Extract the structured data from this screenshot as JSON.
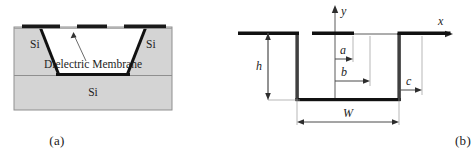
{
  "figure": {
    "panels": [
      {
        "id": "a",
        "caption": "(a)",
        "type": "cross-section-schematic",
        "labels": {
          "si_left": "Si",
          "si_right": "Si",
          "si_bottom": "Si",
          "membrane": "Dielectric Membrane"
        },
        "colors": {
          "substrate_fill": "#d4d4d4",
          "substrate_stroke": "#8c8c8c",
          "membrane_fill": "#ffffff",
          "outline": "#111111",
          "metal": "#1a1a1a"
        },
        "elements": {
          "metal_strip_count": 3,
          "cavity_shape": "trapezoid",
          "callout_arrow": "membrane-pointer"
        }
      },
      {
        "id": "b",
        "caption": "(b)",
        "type": "waveguide-cross-section-dimensions",
        "axes": {
          "y_label": "y",
          "x_label": "x"
        },
        "dimensions": [
          {
            "name": "a",
            "label": "a",
            "kind": "half-width-inner-ridge"
          },
          {
            "name": "b",
            "label": "b",
            "kind": "half-width-outer-ridge"
          },
          {
            "name": "c",
            "label": "c",
            "kind": "half-width-to-sidewall"
          },
          {
            "name": "h",
            "label": "h",
            "kind": "trough-depth"
          },
          {
            "name": "W",
            "label": "W",
            "kind": "total-width"
          }
        ],
        "colors": {
          "conductor": "#111111",
          "dimension_line": "#4a4a4a",
          "axis": "#4a4a4a"
        }
      }
    ]
  }
}
